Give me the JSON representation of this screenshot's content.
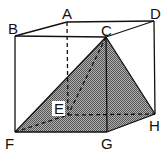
{
  "figure": {
    "type": "cuboid-with-pyramid",
    "vertices": {
      "A": [
        67,
        22
      ],
      "B": [
        15,
        36
      ],
      "C": [
        106,
        37
      ],
      "D": [
        154,
        21
      ],
      "E": [
        68,
        115
      ],
      "F": [
        15,
        132
      ],
      "G": [
        107,
        132
      ],
      "H": [
        155,
        114
      ]
    },
    "labels": [
      {
        "text": "A",
        "x": 62,
        "y": 19
      },
      {
        "text": "B",
        "x": 8,
        "y": 34
      },
      {
        "text": "C",
        "x": 101,
        "y": 36
      },
      {
        "text": "D",
        "x": 150,
        "y": 19
      },
      {
        "text": "E",
        "x": 54,
        "y": 114
      },
      {
        "text": "F",
        "x": 5,
        "y": 149
      },
      {
        "text": "G",
        "x": 101,
        "y": 149
      },
      {
        "text": "H",
        "x": 149,
        "y": 131
      }
    ],
    "shaded_solid": "pyramid C-EFGH",
    "shade_color": "#8a8a8a",
    "line_color": "#111111"
  }
}
